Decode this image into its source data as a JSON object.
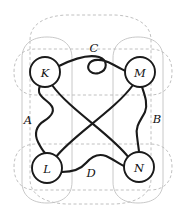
{
  "diagram": {
    "background_color": "#ffffff",
    "edge_color": "#1a1a1a",
    "region_outline_color": "#b9b9b9",
    "node_fill_color": "#ffffff",
    "nodes": [
      {
        "id": "K",
        "label": "K",
        "cx": 45,
        "cy": 72,
        "r": 15
      },
      {
        "id": "M",
        "label": "M",
        "cx": 140,
        "cy": 72,
        "r": 15
      },
      {
        "id": "L",
        "label": "L",
        "cx": 47,
        "cy": 168,
        "r": 15
      },
      {
        "id": "N",
        "label": "N",
        "cx": 139,
        "cy": 167,
        "r": 15
      }
    ],
    "region_labels": [
      {
        "id": "A",
        "label": "A",
        "x": 28,
        "y": 120
      },
      {
        "id": "B",
        "label": "B",
        "x": 157,
        "y": 119
      },
      {
        "id": "C",
        "label": "C",
        "x": 94,
        "y": 48
      },
      {
        "id": "D",
        "label": "D",
        "x": 91,
        "y": 173
      }
    ],
    "edges": [
      {
        "id": "K-M",
        "from": "K",
        "to": "M",
        "style": "curly-loop",
        "region": "C"
      },
      {
        "id": "K-L",
        "from": "K",
        "to": "L",
        "style": "wavy",
        "region": "A"
      },
      {
        "id": "M-N",
        "from": "M",
        "to": "N",
        "style": "wavy",
        "region": "B"
      },
      {
        "id": "L-N",
        "from": "L",
        "to": "N",
        "style": "wavy",
        "region": "D"
      },
      {
        "id": "K-N",
        "from": "K",
        "to": "N",
        "style": "straight",
        "region": ""
      },
      {
        "id": "M-L",
        "from": "M",
        "to": "L",
        "style": "straight",
        "region": ""
      }
    ],
    "regions": [
      {
        "id": "outer",
        "shape": "rounded-rect",
        "style": "dashed"
      },
      {
        "id": "left-col",
        "shape": "rounded-rect",
        "style": "solid-light"
      },
      {
        "id": "right-col",
        "shape": "rounded-rect",
        "style": "solid-light"
      },
      {
        "id": "top-row",
        "shape": "rounded-rect",
        "style": "dashed"
      },
      {
        "id": "bottom-row",
        "shape": "rounded-rect",
        "style": "dashed"
      }
    ]
  }
}
